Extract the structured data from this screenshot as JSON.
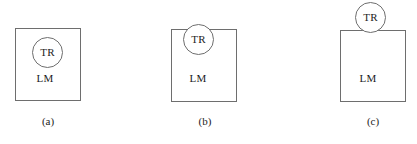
{
  "figure": {
    "background_color": "#ffffff",
    "line_color": "#6e6e6e",
    "text_color": "#1c1c1c",
    "panel_count": 3
  },
  "panels": [
    {
      "id": "a",
      "caption": "(a)",
      "square_label": "LM",
      "circle_label": "TR",
      "relation": "circle-fully-inside-square"
    },
    {
      "id": "b",
      "caption": "(b)",
      "square_label": "LM",
      "circle_label": "TR",
      "relation": "circle-overlapping-top-edge"
    },
    {
      "id": "c",
      "caption": "(c)",
      "square_label": "LM",
      "circle_label": "TR",
      "relation": "circle-tangent-above-top-edge"
    }
  ]
}
